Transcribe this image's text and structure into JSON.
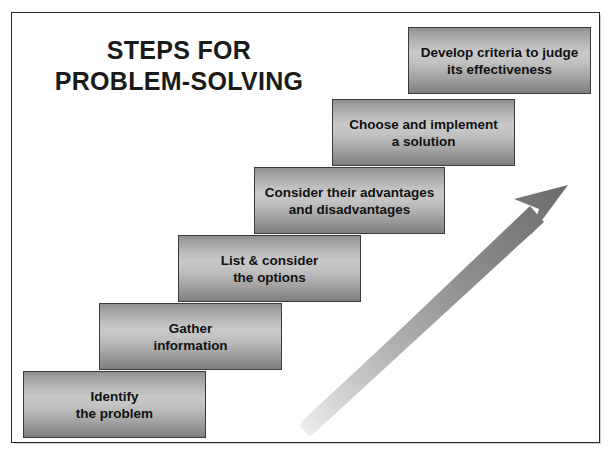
{
  "diagram": {
    "title_lines": [
      "STEPS FOR",
      "PROBLEM-SOLVING"
    ],
    "steps": [
      {
        "index": 1,
        "lines": [
          "Identify",
          "the problem"
        ]
      },
      {
        "index": 2,
        "lines": [
          "Gather",
          "information"
        ]
      },
      {
        "index": 3,
        "lines": [
          "List & consider",
          "the options"
        ]
      },
      {
        "index": 4,
        "lines": [
          "Consider their advantages",
          "and disadvantages"
        ]
      },
      {
        "index": 5,
        "lines": [
          "Choose and implement",
          "a solution"
        ]
      },
      {
        "index": 6,
        "lines": [
          "Develop criteria to judge",
          "its effectiveness"
        ]
      }
    ],
    "arrow": {
      "name": "progress-arrow",
      "direction": "upward-right",
      "tail_color": "#e2e2e2",
      "head_color": "#6e6e6e"
    },
    "colors": {
      "box_border": "#3a3a3a",
      "box_fill_light": "#c9c9c9",
      "box_fill_dark": "#7f7f7f",
      "text": "#111111",
      "frame_border": "#2b2b2b",
      "background": "#ffffff"
    }
  }
}
